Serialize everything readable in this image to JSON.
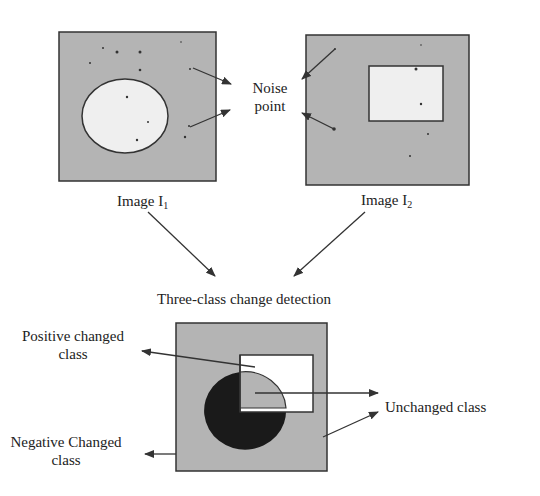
{
  "diagram": {
    "title": "Three-class change detection",
    "colors": {
      "background": "#ffffff",
      "image_fill": "#b4b4b4",
      "region_light": "#efefef",
      "region_white": "#ffffff",
      "negative_region": "#1a1a1a",
      "stroke": "#333333"
    },
    "image1": {
      "label_prefix": "Image  I",
      "label_subscript": "1",
      "shape": "ellipse"
    },
    "image2": {
      "label_prefix": "Image I",
      "label_subscript": "2",
      "shape": "rectangle"
    },
    "noise_label": {
      "line1": "Noise",
      "line2": "point"
    },
    "result": {
      "positive_label_line1": "Positive changed",
      "positive_label_line2": "class",
      "negative_label_line1": "Negative Changed",
      "negative_label_line2": "class",
      "unchanged_label": "Unchanged class"
    }
  }
}
